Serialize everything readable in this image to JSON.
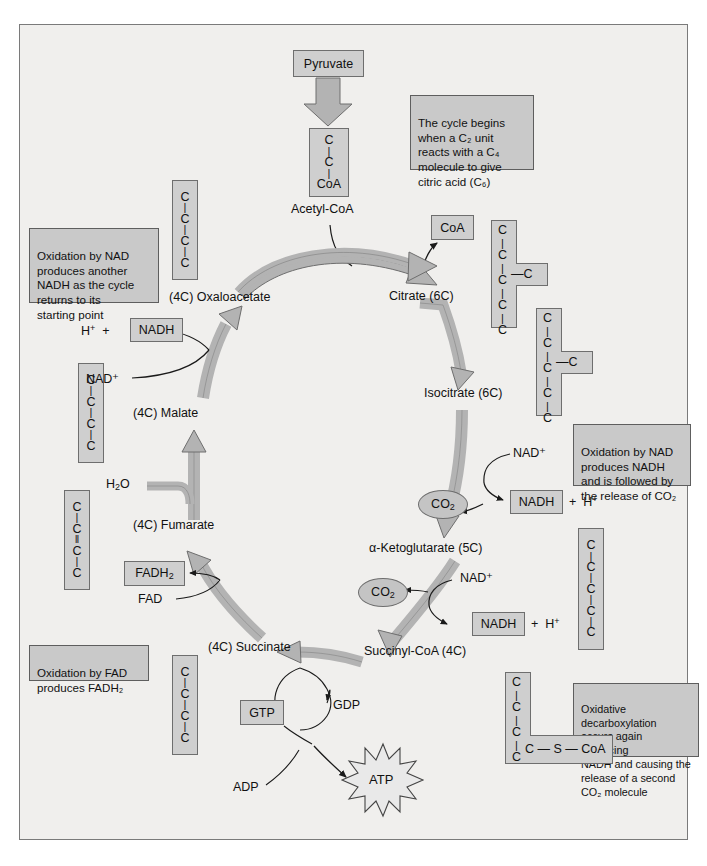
{
  "diagram": {
    "colors": {
      "panel_bg": "#f0efed",
      "box_fill": "#cfcfcf",
      "note_fill": "#c9c9c9",
      "arrow_fill": "#b3b3b3",
      "stroke": "#6e6e6e",
      "text": "#111111"
    }
  },
  "entry": {
    "pyruvate_label": "Pyruvate",
    "acetyl_coa_label": "Acetyl-CoA",
    "acetyl_coa_structure": [
      "C",
      "C",
      "CoA"
    ],
    "coa_label": "CoA"
  },
  "intermediates": [
    {
      "id": "oxaloacetate",
      "label": "(4C) Oxaloacetate",
      "carbons": "4"
    },
    {
      "id": "citrate",
      "label": "Citrate (6C)",
      "carbons": "6"
    },
    {
      "id": "isocitrate",
      "label": "Isocitrate (6C)",
      "carbons": "6"
    },
    {
      "id": "ketoglutarate",
      "label": "α-Ketoglutarate (5C)",
      "carbons": "5"
    },
    {
      "id": "succinyl_coa",
      "label": "Succinyl-CoA (4C)",
      "carbons": "4"
    },
    {
      "id": "succinate",
      "label": "(4C) Succinate",
      "carbons": "4"
    },
    {
      "id": "fumarate",
      "label": "(4C) Fumarate",
      "carbons": "4"
    },
    {
      "id": "malate",
      "label": "(4C) Malate",
      "carbons": "4"
    }
  ],
  "structures": {
    "oxaloacetate": {
      "chain": [
        "C",
        "C",
        "C",
        "C"
      ]
    },
    "citrate": {
      "chain": [
        "C",
        "C",
        "C",
        "C",
        "C"
      ],
      "branch_at": 3,
      "branch": "C"
    },
    "isocitrate": {
      "chain": [
        "C",
        "C",
        "C",
        "C",
        "C"
      ],
      "branch_at": 3,
      "branch": "C"
    },
    "ketoglutarate": {
      "chain": [
        "C",
        "C",
        "C",
        "C",
        "C"
      ]
    },
    "succinyl_coa": {
      "chain": [
        "C",
        "C",
        "C"
      ],
      "tail": "C — S — CoA"
    },
    "succinate": {
      "chain": [
        "C",
        "C",
        "C",
        "C"
      ]
    },
    "fumarate": {
      "chain": [
        "C",
        "C",
        "C",
        "C"
      ],
      "double_bond_between": "2-3"
    },
    "malate": {
      "chain": [
        "C",
        "C",
        "C",
        "C"
      ]
    }
  },
  "cofactors": {
    "nad_plus": "NAD⁺",
    "nadh": "NADH",
    "h_plus": "H⁺",
    "plus": "+",
    "fad": "FAD",
    "fadh2_text": "FADH",
    "fadh2_sub": "2",
    "water_text": "H",
    "water_sub": "2",
    "water_tail": "O",
    "co2_text": "CO",
    "co2_sub": "2",
    "gtp": "GTP",
    "gdp": "GDP",
    "adp": "ADP",
    "atp": "ATP"
  },
  "notes": [
    {
      "id": "note-cycle-begins",
      "text": "The cycle begins\nwhen a C₂ unit\nreacts with a C₄\nmolecule to give\ncitric acid (C₆)"
    },
    {
      "id": "note-oxidation-nad-another",
      "text": "Oxidation by NAD\nproduces another\nNADH as the cycle\nreturns to its\nstarting point"
    },
    {
      "id": "note-oxidation-nad-co2",
      "text": "Oxidation by NAD\nproduces NADH\nand is followed by\nthe release of CO₂"
    },
    {
      "id": "note-oxidative-decarboxylation",
      "text": "Oxidative decarboxylation\noccurs again producing\nNADH and causing the\nrelease of a second\nCO₂ molecule"
    },
    {
      "id": "note-oxidation-fad",
      "text": "Oxidation by FAD\nproduces FADH₂"
    }
  ]
}
